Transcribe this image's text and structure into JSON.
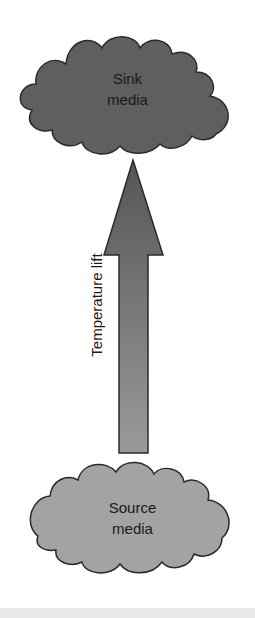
{
  "diagram": {
    "type": "heat-pump temperature lift concept",
    "nodes": [
      {
        "id": "sink",
        "label_line1": "Sink",
        "label_line2": "media",
        "shape": "cloud",
        "fill": "#5f5f5f"
      },
      {
        "id": "source",
        "label_line1": "Source",
        "label_line2": "media",
        "shape": "cloud",
        "fill": "#a3a3a3"
      }
    ],
    "edges": [
      {
        "from": "source",
        "to": "sink",
        "label": "Temperature lift",
        "style": "block-arrow",
        "gradient_top": "#555555",
        "gradient_bottom": "#9a9a9a"
      }
    ]
  },
  "labels": {
    "sink_line1": "Sink",
    "sink_line2": "media",
    "source_line1": "Source",
    "source_line2": "media",
    "arrow": "Temperature lift"
  },
  "colors": {
    "sink_fill": "#5f5f5f",
    "source_fill": "#a3a3a3",
    "outline": "#2a2a2a",
    "arrow_top": "#555555",
    "arrow_bottom": "#9a9a9a"
  }
}
